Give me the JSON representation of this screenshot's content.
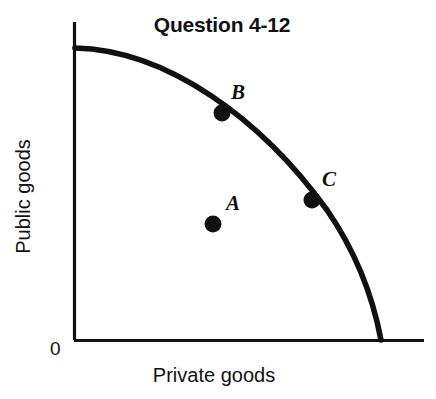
{
  "figure": {
    "title": "Question 4-12",
    "width": 436,
    "height": 399,
    "background": "#ffffff",
    "ink_color": "#111111"
  },
  "axes": {
    "origin_label": "0",
    "x_axis_label": "Private goods",
    "y_axis_label": "Public goods"
  },
  "chart_data": {
    "type": "line",
    "title": "Question 4-12",
    "xlabel": "Private goods",
    "ylabel": "Public goods",
    "grid": false,
    "legend": "none",
    "xlim": [
      0,
      100
    ],
    "ylim": [
      0,
      100
    ],
    "axis_ticks": {
      "x": [
        "0"
      ],
      "y": []
    },
    "series": [
      {
        "name": "Production possibilities frontier",
        "type": "curve",
        "shape": "concave-to-origin",
        "x": [
          0,
          10,
          20,
          30,
          40,
          50,
          60,
          70,
          80,
          90,
          95,
          100
        ],
        "y": [
          100,
          99.5,
          98,
          95.5,
          92,
          87,
          80,
          71,
          58,
          38,
          23,
          0
        ]
      }
    ],
    "annotations": [
      {
        "label": "B",
        "x": 48,
        "y": 78,
        "marker": "filled-circle",
        "position": "on-curve",
        "label_offset": "upper-right"
      },
      {
        "label": "C",
        "x": 77,
        "y": 48,
        "marker": "filled-circle",
        "position": "on-curve",
        "label_offset": "upper-right"
      },
      {
        "label": "A",
        "x": 45,
        "y": 38,
        "marker": "filled-circle",
        "position": "interior",
        "label_offset": "upper-right"
      }
    ]
  },
  "geometry": {
    "y_axis": {
      "x": 74.5,
      "y_top": 22,
      "y_bottom": 340
    },
    "x_axis": {
      "y": 340.5,
      "x_left": 74,
      "x_right": 424
    },
    "curve_path": "M 75 48 C 168 50 262 120 327 210 C 358 255 374 303 381 340",
    "points": {
      "A": {
        "cx": 213,
        "cy": 224,
        "r": 8.5,
        "label_x": 228,
        "label_y": 196
      },
      "B": {
        "cx": 222,
        "cy": 113,
        "r": 8.5,
        "label_x": 234,
        "label_y": 85
      },
      "C": {
        "cx": 312,
        "cy": 200,
        "r": 8.5,
        "label_x": 325,
        "label_y": 172
      }
    }
  }
}
